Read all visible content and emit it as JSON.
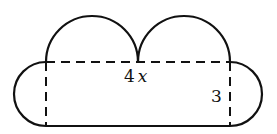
{
  "diagram": {
    "labels": {
      "width_coef": "4",
      "width_var": "x",
      "height": "3"
    }
  }
}
